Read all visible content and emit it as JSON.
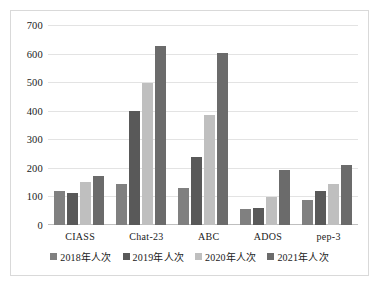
{
  "chart_data": {
    "type": "bar",
    "title": "",
    "xlabel": "",
    "ylabel": "",
    "ylim": [
      0,
      700
    ],
    "ytick_step": 100,
    "yticks": [
      700,
      600,
      500,
      400,
      300,
      200,
      100,
      0
    ],
    "grid": true,
    "legend_position": "bottom",
    "categories": [
      "CIASS",
      "Chat-23",
      "ABC",
      "ADOS",
      "pep-3"
    ],
    "series": [
      {
        "name": "2018年人次",
        "color": "#808080",
        "values": [
          118,
          143,
          131,
          57,
          87
        ]
      },
      {
        "name": "2019年人次",
        "color": "#595959",
        "values": [
          112,
          399,
          238,
          59,
          120
        ]
      },
      {
        "name": "2020年人次",
        "color": "#bfbfbf",
        "values": [
          151,
          498,
          385,
          98,
          144
        ]
      },
      {
        "name": "2021年人次",
        "color": "#6b6b6b",
        "values": [
          171,
          625,
          602,
          194,
          209
        ]
      }
    ]
  },
  "colors": {
    "background": "#ffffff",
    "frame_border": "#d9d9d9",
    "gridline": "#e3e3e3",
    "axis": "#bfbfbf",
    "text": "#1a1a1a"
  }
}
